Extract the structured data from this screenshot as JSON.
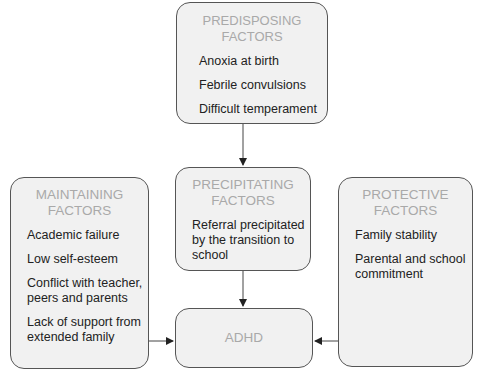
{
  "diagram": {
    "predisposing": {
      "title": "PREDISPOSING FACTORS",
      "items": [
        "Anoxia at birth",
        "Febrile convulsions",
        "Difficult temperament"
      ]
    },
    "precipitating": {
      "title_line1": "PRECIPITATING",
      "title_line2": "FACTORS",
      "items": [
        "Referral precipitated by the transition to school"
      ]
    },
    "maintaining": {
      "title_line1": "MAINTAINING",
      "title_line2": "FACTORS",
      "items": [
        "Academic failure",
        "Low self-esteem",
        "Conflict with teacher, peers and parents",
        "Lack of support from extended family"
      ]
    },
    "protective": {
      "title_line1": "PROTECTIVE",
      "title_line2": "FACTORS",
      "items": [
        "Family stability",
        "Parental and school commitment"
      ]
    },
    "outcome": {
      "title": "ADHD"
    },
    "colors": {
      "box_fill": "#f1f1f1",
      "title_text": "#a9a9a9",
      "body_text": "#222222",
      "border": "#555555"
    }
  }
}
